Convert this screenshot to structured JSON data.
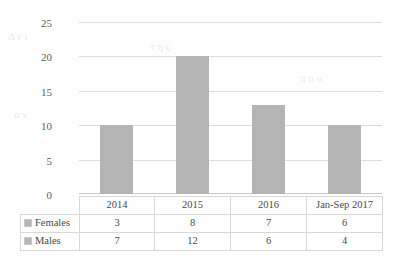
{
  "chart_data": {
    "type": "bar",
    "title": "",
    "subtitle": "",
    "xlabel": "",
    "ylabel": "",
    "categories": [
      "2014",
      "2015",
      "2016",
      "Jan-Sep 2017"
    ],
    "values": [
      10,
      20,
      13,
      10
    ],
    "ylim": [
      0,
      25
    ],
    "yticks": [
      0,
      5,
      10,
      15,
      20,
      25
    ],
    "ytick_labels": [
      "0",
      "5",
      "10",
      "15",
      "20",
      "25"
    ],
    "grid": true,
    "legend_position": "table-left",
    "bar_color": "#b4b4b4",
    "gridline_color": "#dcdcdc",
    "series": [
      {
        "name": "Females",
        "values": [
          3,
          8,
          7,
          6
        ]
      },
      {
        "name": "Males",
        "values": [
          7,
          12,
          6,
          4
        ]
      }
    ],
    "note": "Bars show the column totals (Females + Males) for each period; the data table beneath lists each series."
  },
  "data_table": {
    "corner_label": "",
    "header": [
      "2014",
      "2015",
      "2016",
      "Jan-Sep 2017"
    ],
    "rows": [
      {
        "label": "Females",
        "marker": "legend-swatch",
        "cells": [
          "3",
          "8",
          "7",
          "6"
        ]
      },
      {
        "label": "Males",
        "marker": "legend-swatch",
        "cells": [
          "7",
          "12",
          "6",
          "4"
        ]
      }
    ]
  },
  "background_artifacts": {
    "note": "faint show-through from reverse side of scanned page",
    "marks": [
      "Δ ε ι",
      "τ η ς",
      "α ν",
      "π ο υ"
    ]
  }
}
